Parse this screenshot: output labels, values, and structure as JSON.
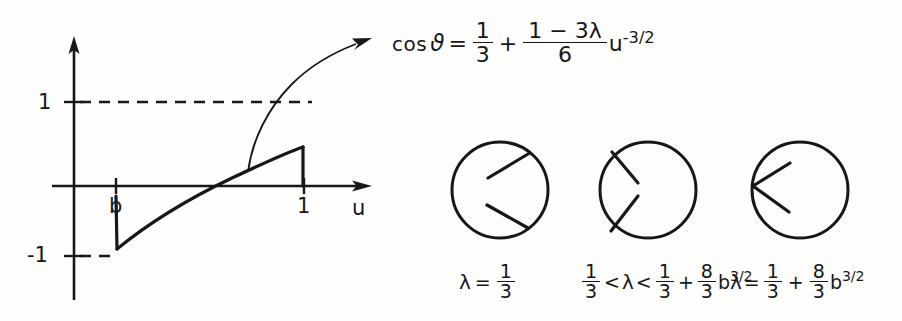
{
  "figure": {
    "background_color": "#fdfdfb",
    "ink_color": "#17171a",
    "graph": {
      "axis_labels": {
        "y_top": "1",
        "y_bottom": "-1",
        "x_b": "b",
        "x_one": "1",
        "x_axis_name": "u"
      },
      "dashed_guides": [
        "y = 1 from axis to u = 1",
        "y = -1 from axis to u = b"
      ],
      "curve_description": "cos theta rises from -1 at u = b through zero, up to just below 1 at u = 1, then drops vertically to the u-axis",
      "annotation_arrow": "curved arrow from the curve to the formula"
    },
    "equation": {
      "lhs_function": "cos",
      "lhs_variable": "ϑ",
      "equals": "=",
      "term1_numerator": "1",
      "term1_denominator": "3",
      "plus": "+",
      "term2_numerator": "1 − 3λ",
      "term2_denominator": "6",
      "factor_base": "u",
      "factor_exponent": "-3/2"
    },
    "diagrams": [
      {
        "name": "circle-case-1",
        "caption": {
          "lambda": "λ",
          "relation": "=",
          "value_numerator": "1",
          "value_denominator": "3"
        },
        "rays": "two short chords meeting the right rim, gap open toward the right"
      },
      {
        "name": "circle-case-2",
        "caption": {
          "lambda": "λ",
          "lower_numerator": "1",
          "lower_denominator": "3",
          "lower_relation": "<",
          "upper_relation": "<",
          "upper_numerator": "1",
          "upper_denominator": "3",
          "plus": "+",
          "coef_numerator": "8",
          "coef_denominator": "3",
          "base": "b",
          "exponent": "3/2"
        },
        "rays": "two short chords meeting the left rim, gap narrowing toward the left"
      },
      {
        "name": "circle-case-3",
        "caption": {
          "lambda": "λ",
          "relation": "=",
          "term1_numerator": "1",
          "term1_denominator": "3",
          "plus": "+",
          "coef_numerator": "8",
          "coef_denominator": "3",
          "base": "b",
          "exponent": "3/2"
        },
        "rays": "two chords converging to a single point on the left rim, forming a wedge"
      }
    ]
  }
}
